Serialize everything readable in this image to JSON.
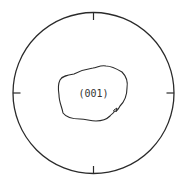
{
  "diagram": {
    "type": "pole-figure",
    "label": "(001)",
    "stroke_color": "#2a2a2a",
    "background": "#ffffff",
    "outer_circle": {
      "cx": 93.5,
      "cy": 93,
      "r": 80.5
    },
    "ticks": [
      "top",
      "right",
      "bottom",
      "left"
    ],
    "contour": "single irregular closed contour around center"
  }
}
